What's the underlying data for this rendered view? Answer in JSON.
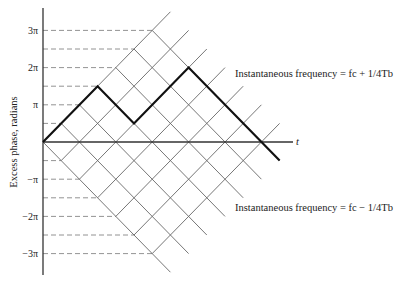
{
  "diagram": {
    "type": "phase-trellis",
    "y_axis": {
      "title": "Excess phase, radians",
      "tick_labels": [
        "3π",
        "2π",
        "π",
        "−π",
        "−2π",
        "−3π"
      ],
      "tick_values_pi": [
        3,
        2,
        1,
        -1,
        -2,
        -3
      ]
    },
    "x_axis": {
      "label": "t"
    },
    "annotations": {
      "upper": "Instantaneous frequency = fc + 1/4Tb",
      "lower": "Instantaneous frequency = fc − 1/4Tb"
    },
    "path_phase_pi_steps": [
      0,
      1.5,
      0.5,
      2,
      -0.5
    ],
    "path_segments_T": [
      3,
      2,
      3,
      5
    ]
  }
}
